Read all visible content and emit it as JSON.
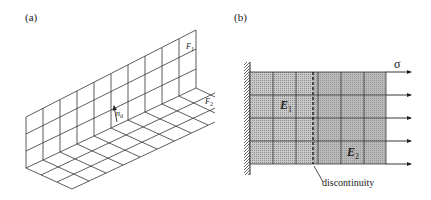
{
  "panel_a": {
    "label": "(a)",
    "face_1": {
      "symbol": "F",
      "subscript": "1"
    },
    "face_2": {
      "symbol": "F",
      "subscript": "2"
    },
    "normal": {
      "symbol": "n",
      "subscript": "d"
    }
  },
  "panel_b": {
    "label": "(b)",
    "region_1": {
      "symbol": "E",
      "subscript": "1"
    },
    "region_2": {
      "symbol": "E",
      "subscript": "2"
    },
    "stress_label": "σ",
    "annotation": "discontinuity",
    "colors": {
      "region_1_fill": "#b8b8b8",
      "region_2_fill": "#a9a9a9",
      "grid_line": "#333333"
    }
  }
}
